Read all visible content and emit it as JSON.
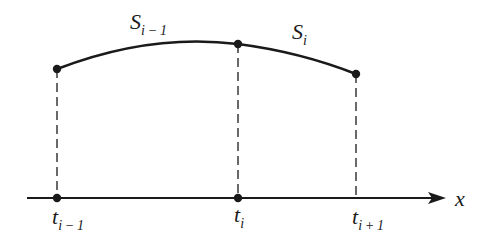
{
  "diagram": {
    "title": "",
    "colors": {
      "stroke": "#1a1a1a",
      "background": "#ffffff"
    },
    "axis": {
      "label": "x",
      "y": 198,
      "x_start": 27,
      "x_end": 446
    },
    "knots": [
      {
        "id": "t_i_minus_1",
        "main": "t",
        "sub": "i − 1",
        "x": 57,
        "curve_y": 69
      },
      {
        "id": "t_i",
        "main": "t",
        "sub": "i",
        "x": 238,
        "curve_y": 44
      },
      {
        "id": "t_i_plus_1",
        "main": "t",
        "sub": "i + 1",
        "x": 356,
        "curve_y": 74
      }
    ],
    "segments": [
      {
        "id": "S_i_minus_1",
        "main": "S",
        "sub": "i − 1",
        "from": "t_i_minus_1",
        "to": "t_i"
      },
      {
        "id": "S_i",
        "main": "S",
        "sub": "i",
        "from": "t_i",
        "to": "t_i_plus_1"
      }
    ]
  }
}
